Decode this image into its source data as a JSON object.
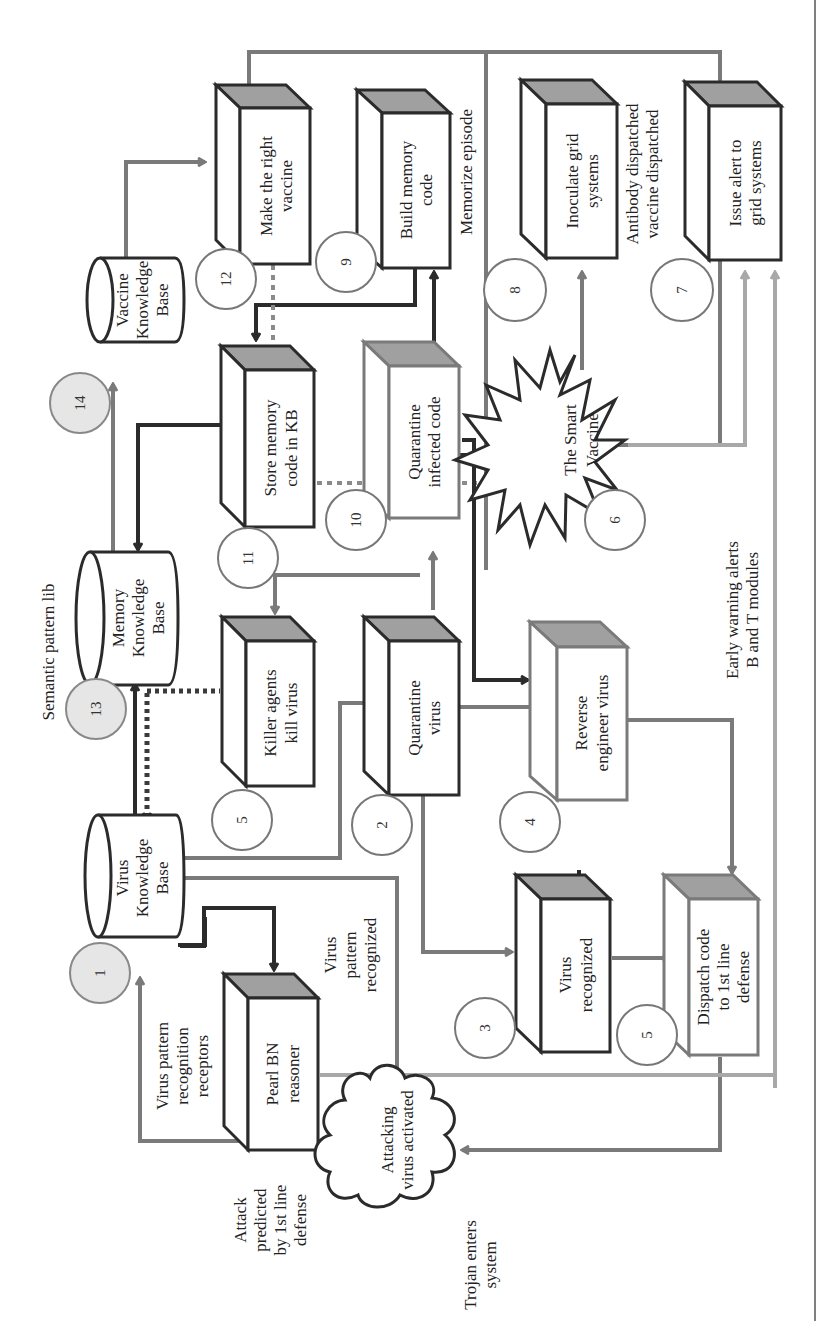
{
  "diagram": {
    "orientation": "rotated 90deg counter-clockwise",
    "colors": {
      "dark": "#2b2b2b",
      "mid": "#7a7a7a",
      "light": "#a8a8a8",
      "box_top": "#a0a0a0",
      "badge_fill": "#e6e6e6"
    },
    "nodes": {
      "virus_kb": {
        "line1": "Virus",
        "line2": "Knowledge",
        "line3": "Base",
        "badge": "1"
      },
      "memory_kb": {
        "line1": "Memory",
        "line2": "Knowledge",
        "line3": "Base",
        "badge": "13"
      },
      "vaccine_kb": {
        "line1": "Vaccine",
        "line2": "Knowledge",
        "line3": "Base",
        "badge": "14"
      },
      "make_vaccine": {
        "line1": "Make the right",
        "line2": "vaccine",
        "badge": "12"
      },
      "build_memory": {
        "line1": "Build memory",
        "line2": "code",
        "badge": "9"
      },
      "inoculate": {
        "line1": "Inoculate grid",
        "line2": "systems",
        "badge": "8"
      },
      "issue_alert": {
        "line1": "Issue alert to",
        "line2": "grid systems",
        "badge": "7"
      },
      "store_memory": {
        "line1": "Store memory",
        "line2": "code in KB",
        "badge": "11"
      },
      "quarantine_code": {
        "line1": "Quarantine",
        "line2": "infected code",
        "badge": "10"
      },
      "smart_vaccine": {
        "line1": "The Smart",
        "line2": "Vaccine",
        "badge": "6"
      },
      "killer_agents": {
        "line1": "Killer agents",
        "line2": "kill virus",
        "badge": "5"
      },
      "quarantine_virus": {
        "line1": "Quarantine",
        "line2": "virus",
        "badge": "2"
      },
      "reverse_engineer": {
        "line1": "Reverse",
        "line2": "engineer virus",
        "badge": "4"
      },
      "virus_recognized": {
        "line1": "Virus",
        "line2": "recognized",
        "badge": "3"
      },
      "dispatch_code": {
        "line1": "Dispatch code",
        "line2": "to 1st line",
        "line3": "defense",
        "badge": "5"
      },
      "pearl_bn": {
        "line1": "Pearl BN",
        "line2": "reasoner"
      },
      "attacking_virus": {
        "line1": "Attacking",
        "line2": "virus activated"
      }
    },
    "annotations": {
      "semantic_pattern": "Semantic pattern lib",
      "memorize_episode": "Memorize episode",
      "antibody_1": "Antibody dispatched",
      "antibody_2": "vaccine dispatched",
      "early_warning_1": "Early warning alerts",
      "early_warning_2": "B and T modules",
      "virus_pattern_rec_1": "Virus",
      "virus_pattern_rec_2": "pattern",
      "virus_pattern_rec_3": "recognized",
      "receptors_1": "Virus pattern",
      "receptors_2": "recognition",
      "receptors_3": "receptors",
      "attack_predicted_1": "Attack",
      "attack_predicted_2": "predicted",
      "attack_predicted_3": "by 1st line",
      "attack_predicted_4": "defense",
      "trojan_1": "Trojan enters",
      "trojan_2": "system"
    }
  }
}
